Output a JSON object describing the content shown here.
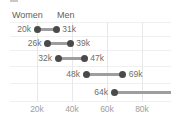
{
  "legend": {
    "women": "Women",
    "men": "Men"
  },
  "colors": {
    "dot": "#4a4a4a",
    "connector": "#9e9e9e",
    "value_label": "#6e6e6e",
    "axis_label": "#9e9e9e",
    "legend_label": "#616161",
    "grid_vertical": "#e8e8e8",
    "grid_horizontal": "#f0f0f0",
    "background": "#ffffff"
  },
  "chart_data": {
    "type": "dumbbell",
    "orientation": "horizontal",
    "legend_position": "top-left",
    "grid": true,
    "series": [
      {
        "name": "Women",
        "values": [
          20000,
          26000,
          32000,
          48000,
          64000
        ],
        "labels": [
          "20k",
          "26k",
          "32k",
          "48k",
          "64k"
        ]
      },
      {
        "name": "Men",
        "values": [
          31000,
          39000,
          47000,
          69000,
          null
        ],
        "labels": [
          "31k",
          "39k",
          "47k",
          "69k",
          null
        ],
        "note": "5th connector extends past the right edge of the chart; end dot and label are clipped out of view"
      }
    ],
    "x_axis": {
      "tick_values": [
        20000,
        40000,
        60000,
        80000
      ],
      "tick_labels": [
        "20k",
        "40k",
        "60k",
        "80k"
      ],
      "visible_range": [
        0,
        96000
      ]
    }
  }
}
